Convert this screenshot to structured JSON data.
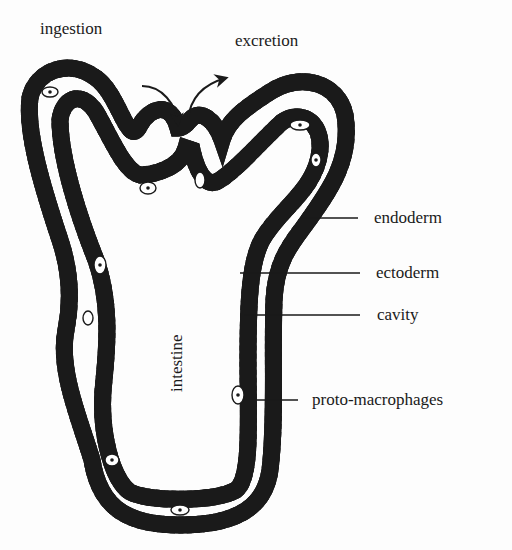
{
  "diagram": {
    "top_labels": {
      "ingestion": "ingestion",
      "excretion": "excretion"
    },
    "inner_label": "intestine",
    "side_labels": [
      {
        "id": "endoderm",
        "text": "endoderm"
      },
      {
        "id": "ectoderm",
        "text": "ectoderm"
      },
      {
        "id": "cavity",
        "text": "cavity"
      },
      {
        "id": "proto-macrophages",
        "text": "proto-macrophages"
      }
    ],
    "colors": {
      "ink": "#1a1a1a",
      "background": "#fdfdfd",
      "cell_interior": "#ffffff"
    }
  }
}
